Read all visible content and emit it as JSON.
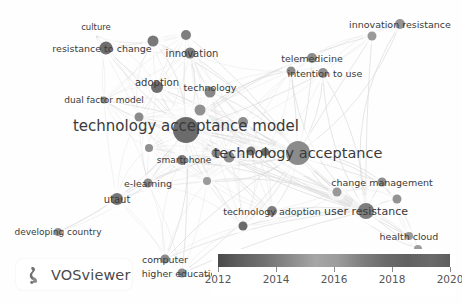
{
  "app": {
    "name": "VOSviewer",
    "watermark_label": "VOSviewer",
    "logo_icon": "vosviewer-logo-icon"
  },
  "canvas": {
    "width": 462,
    "height": 304,
    "background": "#fefefe",
    "node_color": "#8c8c8c",
    "edge_color": "#d9d9d9",
    "label_color": "#3a3a3a"
  },
  "legend": {
    "title": "",
    "type": "continuous-color-scale",
    "min": 2012,
    "max": 2020,
    "ticks": [
      2012,
      2014,
      2016,
      2018,
      2020
    ],
    "tick_labels": [
      "2012",
      "2014",
      "2016",
      "2018",
      "2020"
    ],
    "gradient_stops": [
      "#4a4a4a",
      "#717171",
      "#a6a6a6",
      "#7f7f7f",
      "#5e5e5e"
    ]
  },
  "chart_data": {
    "type": "scatter",
    "title": "",
    "xlabel": "",
    "ylabel": "",
    "nodes": [
      {
        "id": "culture",
        "label": "culture",
        "x": 96,
        "y": 36,
        "r": 0,
        "label_size": 8.5,
        "shade": "#8f8f8f",
        "label_dx": 0,
        "label_dy": -9
      },
      {
        "id": "resistance-to-change",
        "label": "resistance to change",
        "x": 106,
        "y": 48,
        "r": 6.5,
        "label_size": 9.5,
        "shade": "#6e6e6e",
        "label_dx": -4,
        "label_dy": 0
      },
      {
        "id": "innovation",
        "label": "innovation",
        "x": 190,
        "y": 53,
        "r": 5.5,
        "label_size": 10,
        "shade": "#7c7c7c",
        "label_dx": 2,
        "label_dy": 0
      },
      {
        "id": "node-a",
        "label": "",
        "x": 153,
        "y": 41,
        "r": 5.5,
        "label_size": 0,
        "shade": "#787878",
        "label_dx": 0,
        "label_dy": 0
      },
      {
        "id": "node-b",
        "label": "",
        "x": 186,
        "y": 35,
        "r": 5,
        "label_size": 0,
        "shade": "#7f7f7f",
        "label_dx": 0,
        "label_dy": 0
      },
      {
        "id": "adoption",
        "label": "adoption",
        "x": 157,
        "y": 87,
        "r": 6,
        "label_size": 10,
        "shade": "#6f6f6f",
        "label_dx": 0,
        "label_dy": -5
      },
      {
        "id": "technology",
        "label": "technology",
        "x": 210,
        "y": 92,
        "r": 5.5,
        "label_size": 9.5,
        "shade": "#878787",
        "label_dx": 0,
        "label_dy": -5
      },
      {
        "id": "dual-factor-model",
        "label": "dual factor model",
        "x": 104,
        "y": 100,
        "r": 3.5,
        "label_size": 9,
        "shade": "#8a8a8a",
        "label_dx": 0,
        "label_dy": 0
      },
      {
        "id": "technology-acceptance-model",
        "label": "technology acceptance model",
        "x": 186,
        "y": 130,
        "r": 13,
        "label_size": 15,
        "shade": "#6b6b6b",
        "label_dx": 0,
        "label_dy": -4
      },
      {
        "id": "technology-acceptance",
        "label": "technology acceptance",
        "x": 298,
        "y": 153,
        "r": 12,
        "label_size": 14.5,
        "shade": "#8b8b8b",
        "label_dx": 0,
        "label_dy": 0
      },
      {
        "id": "smartphone",
        "label": "smartphone",
        "x": 182,
        "y": 160,
        "r": 5,
        "label_size": 9,
        "shade": "#7a7a7a",
        "label_dx": 2,
        "label_dy": 0
      },
      {
        "id": "telemedicine",
        "label": "telemedicine",
        "x": 312,
        "y": 58,
        "r": 5,
        "label_size": 9.5,
        "shade": "#8c8c8c",
        "label_dx": 0,
        "label_dy": 0
      },
      {
        "id": "intention-to-use",
        "label": "intention to use",
        "x": 323,
        "y": 73,
        "r": 5,
        "label_size": 9.5,
        "shade": "#8f8f8f",
        "label_dx": 2,
        "label_dy": 0
      },
      {
        "id": "innovation-resistance",
        "label": "innovation resistance",
        "x": 400,
        "y": 24,
        "r": 5,
        "label_size": 9.5,
        "shade": "#949494",
        "label_dx": 0,
        "label_dy": 0
      },
      {
        "id": "e-learning",
        "label": "e-learning",
        "x": 148,
        "y": 183,
        "r": 4.5,
        "label_size": 9.5,
        "shade": "#8a8a8a",
        "label_dx": 0,
        "label_dy": 0
      },
      {
        "id": "utaut",
        "label": "utaut",
        "x": 117,
        "y": 199,
        "r": 6,
        "label_size": 10,
        "shade": "#757575",
        "label_dx": 0,
        "label_dy": 0
      },
      {
        "id": "developing-country",
        "label": "developing country",
        "x": 58,
        "y": 232,
        "r": 4,
        "label_size": 9,
        "shade": "#8d8d8d",
        "label_dx": 0,
        "label_dy": 0
      },
      {
        "id": "technology-adoption",
        "label": "technology adoption",
        "x": 272,
        "y": 211,
        "r": 5,
        "label_size": 9.5,
        "shade": "#7e7e7e",
        "label_dx": 0,
        "label_dy": 0
      },
      {
        "id": "user-resistance",
        "label": "user resistance",
        "x": 366,
        "y": 211,
        "r": 8,
        "label_size": 11,
        "shade": "#7d7d7d",
        "label_dx": 0,
        "label_dy": 0
      },
      {
        "id": "change-management",
        "label": "change management",
        "x": 382,
        "y": 182,
        "r": 4.5,
        "label_size": 9.5,
        "shade": "#8e8e8e",
        "label_dx": 0,
        "label_dy": 0
      },
      {
        "id": "health-cloud",
        "label": "health cloud",
        "x": 409,
        "y": 236,
        "r": 4,
        "label_size": 9.5,
        "shade": "#9a9a9a",
        "label_dx": 0,
        "label_dy": 0
      },
      {
        "id": "computer",
        "label": "computer",
        "x": 165,
        "y": 259,
        "r": 4.5,
        "label_size": 9.5,
        "shade": "#8a8a8a",
        "label_dx": 0,
        "label_dy": 0
      },
      {
        "id": "higher-education",
        "label": "higher education",
        "x": 182,
        "y": 273,
        "r": 4.5,
        "label_size": 9.5,
        "shade": "#888888",
        "label_dx": 0,
        "label_dy": 0
      }
    ],
    "extra_nodes": [
      {
        "x": 229,
        "y": 157,
        "r": 5.5,
        "shade": "#8d8d8d"
      },
      {
        "x": 251,
        "y": 151,
        "r": 4.5,
        "shade": "#757575"
      },
      {
        "x": 265,
        "y": 152,
        "r": 4,
        "shade": "#6d6d6d"
      },
      {
        "x": 200,
        "y": 110,
        "r": 5.5,
        "shade": "#919191"
      },
      {
        "x": 139,
        "y": 117,
        "r": 4.5,
        "shade": "#8b8b8b"
      },
      {
        "x": 149,
        "y": 148,
        "r": 4,
        "shade": "#8f8f8f"
      },
      {
        "x": 207,
        "y": 181,
        "r": 4,
        "shade": "#9b9b9b"
      },
      {
        "x": 243,
        "y": 226,
        "r": 4.5,
        "shade": "#6b6b6b"
      },
      {
        "x": 337,
        "y": 192,
        "r": 4.5,
        "shade": "#989898"
      },
      {
        "x": 397,
        "y": 199,
        "r": 4.5,
        "shade": "#939393"
      },
      {
        "x": 418,
        "y": 249,
        "r": 4,
        "shade": "#9d9d9d"
      },
      {
        "x": 372,
        "y": 36,
        "r": 4.5,
        "shade": "#9a9a9a"
      },
      {
        "x": 291,
        "y": 71,
        "r": 4.5,
        "shade": "#8b8b8b"
      },
      {
        "x": 243,
        "y": 122,
        "r": 5,
        "shade": "#8d8d8d"
      },
      {
        "x": 216,
        "y": 153,
        "r": 4.5,
        "shade": "#858585"
      }
    ],
    "x_range": [
      0,
      462
    ],
    "y_range": [
      0,
      304
    ],
    "grid": false,
    "legend_position": "bottom-right"
  }
}
